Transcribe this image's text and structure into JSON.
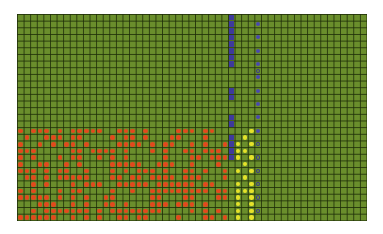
{
  "board": {
    "cols": 53,
    "rows": 31,
    "colors": {
      "field": "#6a8e2c",
      "grid_line": "#1e2d08",
      "orange": "#e2491d",
      "yellow": "#e6e22a",
      "blue": "#3e3a9c"
    },
    "orange_region": {
      "col_start": 0,
      "col_end": 31,
      "row_start": 17,
      "row_end": 30
    },
    "blue_square_column": {
      "col": 32,
      "rows": [
        0,
        1,
        2,
        3,
        4,
        5,
        6,
        7,
        11,
        12,
        15,
        16,
        18,
        19,
        20,
        21
      ]
    },
    "blue_circle_column": {
      "col": 36,
      "filled_rows": [
        1,
        3,
        5,
        7,
        9,
        11,
        13,
        15,
        17
      ],
      "ring_rows": [
        8,
        19,
        21,
        23,
        25,
        27,
        29
      ]
    },
    "yellow_columns": [
      {
        "col": 33,
        "rows": [
          19,
          20,
          21,
          23,
          25,
          26,
          27,
          28,
          29,
          30
        ]
      },
      {
        "col": 34,
        "rows": [
          18,
          20,
          22,
          24,
          26
        ]
      },
      {
        "col": 35,
        "rows": [
          17,
          19,
          21,
          23,
          25,
          26,
          27,
          28,
          29,
          30
        ]
      }
    ]
  }
}
